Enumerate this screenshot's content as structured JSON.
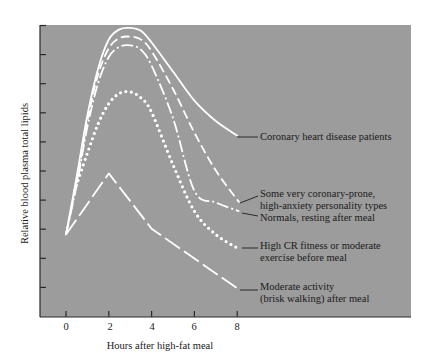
{
  "chart_data": {
    "type": "line",
    "title": "",
    "xlabel": "Hours after high-fat meal",
    "ylabel": "Relative blood plasma total lipids",
    "x_ticks": [
      0,
      2,
      4,
      6,
      8
    ],
    "xlim": [
      -1.2,
      16.1
    ],
    "ylim": [
      0,
      10
    ],
    "y_ticks_count": 10,
    "y_tick_labels": [],
    "grid": false,
    "legend_position": "right, inline labels with leader lines",
    "background_color": "#9c9c9c",
    "line_color": "#ffffff",
    "series": [
      {
        "name": "Coronary heart disease patients",
        "style": "solid",
        "x": [
          0,
          0.5,
          1.0,
          1.5,
          2.0,
          2.5,
          3.0,
          3.5,
          4.0,
          5.0,
          6.0,
          7.0,
          8.0
        ],
        "values": [
          2.8,
          4.8,
          6.9,
          8.5,
          9.5,
          9.85,
          9.9,
          9.8,
          9.4,
          8.4,
          7.4,
          6.7,
          6.2
        ]
      },
      {
        "name": "Some very coronary-prone, high-anxiety personality types",
        "style": "dashed",
        "x": [
          0,
          0.5,
          1.0,
          1.5,
          2.0,
          2.5,
          3.0,
          3.5,
          4.0,
          5.0,
          6.0,
          7.0,
          8.1
        ],
        "values": [
          2.8,
          4.6,
          6.7,
          8.3,
          9.2,
          9.55,
          9.6,
          9.5,
          9.1,
          7.8,
          6.3,
          5.0,
          3.9
        ]
      },
      {
        "name": "Normals, resting after meal",
        "style": "dash-dot",
        "x": [
          0,
          0.5,
          1.0,
          1.5,
          2.0,
          2.5,
          3.0,
          3.5,
          4.0,
          5.0,
          6.0,
          7.0,
          8.1
        ],
        "values": [
          2.8,
          4.5,
          6.5,
          8.0,
          8.9,
          9.25,
          9.3,
          9.15,
          8.6,
          6.8,
          4.3,
          3.9,
          3.6
        ]
      },
      {
        "name": "High CR fitness or moderate exercise before meal",
        "style": "dotted",
        "x": [
          0.4,
          1.0,
          1.5,
          2.0,
          2.5,
          3.0,
          3.5,
          4.0,
          5.0,
          6.0,
          7.0,
          8.1
        ],
        "values": [
          4.3,
          5.6,
          6.6,
          7.3,
          7.65,
          7.7,
          7.5,
          7.0,
          5.2,
          3.6,
          2.8,
          2.3
        ]
      },
      {
        "name": "Moderate activity (brisk walking) after meal",
        "style": "long-dash",
        "x": [
          0,
          2.0,
          4.0,
          8.1
        ],
        "values": [
          2.8,
          4.9,
          3.0,
          0.9
        ]
      }
    ]
  },
  "axes": {
    "xlabel": "Hours after high-fat meal",
    "ylabel": "Relative blood plasma total lipids",
    "x_tick_labels": [
      "0",
      "2",
      "4",
      "6",
      "8"
    ]
  },
  "legend": {
    "chd": [
      "Coronary heart disease patients"
    ],
    "prone": [
      "Some very coronary-prone,",
      "high-anxiety personality types"
    ],
    "normals": [
      "Normals, resting after meal"
    ],
    "highcr": [
      "High CR fitness or moderate",
      "exercise before meal"
    ],
    "moderate": [
      "Moderate activity",
      "(brisk walking) after meal"
    ]
  }
}
